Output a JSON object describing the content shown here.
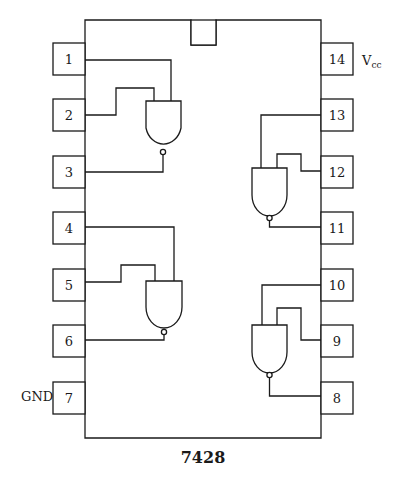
{
  "chip": {
    "part_number": "7428",
    "description": "Quad 2-input NOR buffer pinout"
  },
  "pins": {
    "left": [
      "1",
      "2",
      "3",
      "4",
      "5",
      "6",
      "7"
    ],
    "right": [
      "14",
      "13",
      "12",
      "11",
      "10",
      "9",
      "8"
    ]
  },
  "labels": {
    "vcc_main": "V",
    "vcc_sub": "cc",
    "gnd": "GND"
  }
}
